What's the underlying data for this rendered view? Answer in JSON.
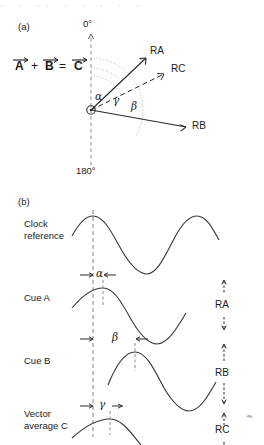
{
  "figure": {
    "panel_a_label": "(a)",
    "panel_b_label": "(b)",
    "top_cut_text": "· ·  ·· ·  ·  ·  ·  ·"
  },
  "panel_a": {
    "equation": {
      "term_a": "A",
      "plus": "+",
      "term_b": "B",
      "equals": "=",
      "term_c": "C"
    },
    "axis": {
      "top_label": "0°",
      "bottom_label": "180°"
    },
    "angles": [
      {
        "name": "alpha",
        "symbol": "α",
        "description": "angle between 0° axis and RA"
      },
      {
        "name": "gamma",
        "symbol": "γ",
        "description": "angle between 0° axis and RC"
      },
      {
        "name": "beta",
        "symbol": "β",
        "description": "angle between 0° axis and RB"
      }
    ],
    "vectors": [
      {
        "name": "RA",
        "label": "RA",
        "style": "solid",
        "angle_deg": 40,
        "length": 78
      },
      {
        "name": "RC",
        "label": "RC",
        "style": "dashed",
        "angle_deg": 62,
        "length": 86
      },
      {
        "name": "RB",
        "label": "RB",
        "style": "solid",
        "angle_deg": 100,
        "length": 104
      }
    ],
    "origin_marker": "circle"
  },
  "panel_b": {
    "rows": [
      {
        "name": "clock-reference",
        "label_line1": "Clock",
        "label_line2": "reference",
        "phase_symbol": null,
        "amplitude_label": null
      },
      {
        "name": "cue-a",
        "label_line1": "Cue A",
        "label_line2": "",
        "phase_symbol": "α",
        "amplitude_label": "RA"
      },
      {
        "name": "cue-b",
        "label_line1": "Cue B",
        "label_line2": "",
        "phase_symbol": "β",
        "amplitude_label": "RB"
      },
      {
        "name": "vector-average-c",
        "label_line1": "Vector",
        "label_line2": "average C",
        "phase_symbol": "γ",
        "amplitude_label": "RC"
      }
    ],
    "reference_line": "vertical dashed clock reference at peak of clock waveform"
  },
  "colors": {
    "ink": "#1a1a1a",
    "wave": "#3a3a3a",
    "dashed_guide": "#8c8c8c",
    "arc_dots": "#a9a9a9",
    "background": "#ffffff"
  }
}
